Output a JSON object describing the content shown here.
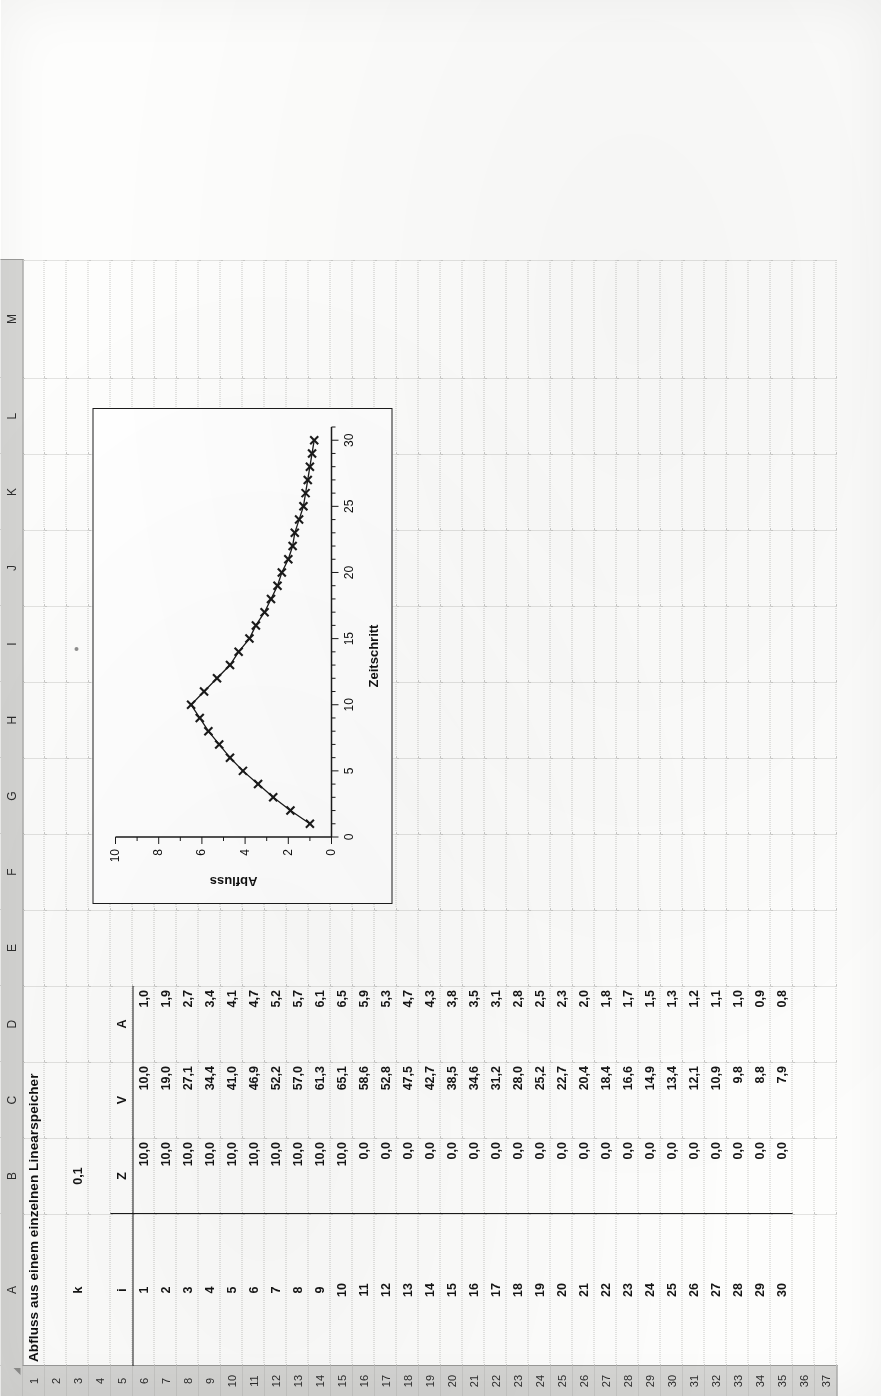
{
  "app": {
    "type": "spreadsheet",
    "select_all_corner": "select-all",
    "column_headers": [
      "A",
      "B",
      "C",
      "D",
      "E",
      "F",
      "G",
      "H",
      "I",
      "J",
      "K",
      "L",
      "M"
    ],
    "row_headers": [
      "1",
      "2",
      "3",
      "4",
      "5",
      "6",
      "7",
      "8",
      "9",
      "10",
      "11",
      "12",
      "13",
      "14",
      "15",
      "16",
      "17",
      "18",
      "19",
      "20",
      "21",
      "22",
      "23",
      "24",
      "25",
      "26",
      "27",
      "28",
      "29",
      "30",
      "31",
      "32",
      "33",
      "34",
      "35",
      "36",
      "37"
    ],
    "header_bg": "#d6d6d4",
    "grid_color": "#c9c9c7"
  },
  "sheet": {
    "title": "Abfluss aus einem einzelnen Linearspeicher",
    "title_cell": "A1",
    "parameter": {
      "name_cell": "A3",
      "name": "k",
      "value_cell": "B3",
      "value": "0,1"
    },
    "table": {
      "header_row": "5",
      "headers": [
        "i",
        "Z",
        "V",
        "A"
      ],
      "header_cells": [
        "A5",
        "B5",
        "C5",
        "D5"
      ],
      "first_data_row": 6,
      "rows": [
        {
          "i": "1",
          "Z": "10,0",
          "V": "10,0",
          "A": "1,0"
        },
        {
          "i": "2",
          "Z": "10,0",
          "V": "19,0",
          "A": "1,9"
        },
        {
          "i": "3",
          "Z": "10,0",
          "V": "27,1",
          "A": "2,7"
        },
        {
          "i": "4",
          "Z": "10,0",
          "V": "34,4",
          "A": "3,4"
        },
        {
          "i": "5",
          "Z": "10,0",
          "V": "41,0",
          "A": "4,1"
        },
        {
          "i": "6",
          "Z": "10,0",
          "V": "46,9",
          "A": "4,7"
        },
        {
          "i": "7",
          "Z": "10,0",
          "V": "52,2",
          "A": "5,2"
        },
        {
          "i": "8",
          "Z": "10,0",
          "V": "57,0",
          "A": "5,7"
        },
        {
          "i": "9",
          "Z": "10,0",
          "V": "61,3",
          "A": "6,1"
        },
        {
          "i": "10",
          "Z": "10,0",
          "V": "65,1",
          "A": "6,5"
        },
        {
          "i": "11",
          "Z": "0,0",
          "V": "58,6",
          "A": "5,9"
        },
        {
          "i": "12",
          "Z": "0,0",
          "V": "52,8",
          "A": "5,3"
        },
        {
          "i": "13",
          "Z": "0,0",
          "V": "47,5",
          "A": "4,7"
        },
        {
          "i": "14",
          "Z": "0,0",
          "V": "42,7",
          "A": "4,3"
        },
        {
          "i": "15",
          "Z": "0,0",
          "V": "38,5",
          "A": "3,8"
        },
        {
          "i": "16",
          "Z": "0,0",
          "V": "34,6",
          "A": "3,5"
        },
        {
          "i": "17",
          "Z": "0,0",
          "V": "31,2",
          "A": "3,1"
        },
        {
          "i": "18",
          "Z": "0,0",
          "V": "28,0",
          "A": "2,8"
        },
        {
          "i": "19",
          "Z": "0,0",
          "V": "25,2",
          "A": "2,5"
        },
        {
          "i": "20",
          "Z": "0,0",
          "V": "22,7",
          "A": "2,3"
        },
        {
          "i": "21",
          "Z": "0,0",
          "V": "20,4",
          "A": "2,0"
        },
        {
          "i": "22",
          "Z": "0,0",
          "V": "18,4",
          "A": "1,8"
        },
        {
          "i": "23",
          "Z": "0,0",
          "V": "16,6",
          "A": "1,7"
        },
        {
          "i": "24",
          "Z": "0,0",
          "V": "14,9",
          "A": "1,5"
        },
        {
          "i": "25",
          "Z": "0,0",
          "V": "13,4",
          "A": "1,3"
        },
        {
          "i": "26",
          "Z": "0,0",
          "V": "12,1",
          "A": "1,2"
        },
        {
          "i": "27",
          "Z": "0,0",
          "V": "10,9",
          "A": "1,1"
        },
        {
          "i": "28",
          "Z": "0,0",
          "V": "9,8",
          "A": "1,0"
        },
        {
          "i": "29",
          "Z": "0,0",
          "V": "8,8",
          "A": "0,9"
        },
        {
          "i": "30",
          "Z": "0,0",
          "V": "7,9",
          "A": "0,8"
        }
      ]
    }
  },
  "chart_data": {
    "type": "line",
    "title": "",
    "xlabel": "Zeitschritt",
    "ylabel": "Abfluss",
    "xlim": [
      0,
      31
    ],
    "ylim": [
      0,
      10
    ],
    "xticks": [
      "0",
      "5",
      "10",
      "15",
      "20",
      "25",
      "30"
    ],
    "xtick_values": [
      0,
      5,
      10,
      15,
      20,
      25,
      30
    ],
    "yticks": [
      "0",
      "2",
      "4",
      "6",
      "8",
      "10"
    ],
    "ytick_values": [
      0,
      2,
      4,
      6,
      8,
      10
    ],
    "grid": false,
    "legend": "none",
    "marker": "x",
    "line_color": "#1a1a1a",
    "series": [
      {
        "name": "Abfluss",
        "x": [
          1,
          2,
          3,
          4,
          5,
          6,
          7,
          8,
          9,
          10,
          11,
          12,
          13,
          14,
          15,
          16,
          17,
          18,
          19,
          20,
          21,
          22,
          23,
          24,
          25,
          26,
          27,
          28,
          29,
          30
        ],
        "values": [
          1.0,
          1.9,
          2.7,
          3.4,
          4.1,
          4.7,
          5.2,
          5.7,
          6.1,
          6.5,
          5.9,
          5.3,
          4.7,
          4.3,
          3.8,
          3.5,
          3.1,
          2.8,
          2.5,
          2.3,
          2.0,
          1.8,
          1.7,
          1.5,
          1.3,
          1.2,
          1.1,
          1.0,
          0.9,
          0.8
        ]
      }
    ]
  }
}
